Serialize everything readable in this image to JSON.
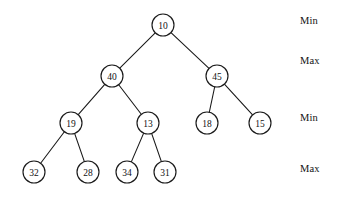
{
  "figure": {
    "background_color": "#ffffff",
    "stroke_color": "#1a1a1a",
    "node_fill": "#ffffff",
    "node_radius": 11
  },
  "chart_data": {
    "type": "diagram",
    "diagram_kind": "min-max-heap-tree",
    "title": "",
    "nodes": [
      {
        "id": "n10",
        "label": "10",
        "x": 163,
        "y": 25,
        "level": 0
      },
      {
        "id": "n40",
        "label": "40",
        "x": 112,
        "y": 76,
        "level": 1
      },
      {
        "id": "n45",
        "label": "45",
        "x": 217,
        "y": 76,
        "level": 1
      },
      {
        "id": "n19",
        "label": "19",
        "x": 71,
        "y": 123,
        "level": 2
      },
      {
        "id": "n13",
        "label": "13",
        "x": 148,
        "y": 123,
        "level": 2
      },
      {
        "id": "n18",
        "label": "18",
        "x": 207,
        "y": 123,
        "level": 2
      },
      {
        "id": "n15",
        "label": "15",
        "x": 260,
        "y": 123,
        "level": 2
      },
      {
        "id": "n32",
        "label": "32",
        "x": 34,
        "y": 172,
        "level": 3
      },
      {
        "id": "n28",
        "label": "28",
        "x": 88,
        "y": 172,
        "level": 3
      },
      {
        "id": "n34",
        "label": "34",
        "x": 127,
        "y": 172,
        "level": 3
      },
      {
        "id": "n31",
        "label": "31",
        "x": 165,
        "y": 172,
        "level": 3
      }
    ],
    "edges": [
      {
        "from": "n10",
        "to": "n40"
      },
      {
        "from": "n10",
        "to": "n45"
      },
      {
        "from": "n40",
        "to": "n19"
      },
      {
        "from": "n40",
        "to": "n13"
      },
      {
        "from": "n45",
        "to": "n18"
      },
      {
        "from": "n45",
        "to": "n15"
      },
      {
        "from": "n19",
        "to": "n32"
      },
      {
        "from": "n19",
        "to": "n28"
      },
      {
        "from": "n13",
        "to": "n34"
      },
      {
        "from": "n13",
        "to": "n31"
      }
    ],
    "level_labels": [
      {
        "text": "Min",
        "level": 0,
        "x": 300,
        "y": 15
      },
      {
        "text": "Max",
        "level": 1,
        "x": 300,
        "y": 55
      },
      {
        "text": "Min",
        "level": 2,
        "x": 300,
        "y": 112
      },
      {
        "text": "Max",
        "level": 3,
        "x": 300,
        "y": 163
      }
    ]
  }
}
